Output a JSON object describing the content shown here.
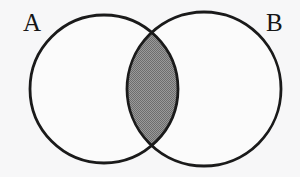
{
  "figure": {
    "type": "venn-diagram",
    "background_color": "#f7f7f8",
    "stroke_color": "#1a1a1a",
    "stroke_width": 2.8,
    "fill_color": "#fbfbfb",
    "shade_color": "#8a8a8a",
    "shade_pattern": "halftone-dither"
  },
  "sets": [
    {
      "id": "A",
      "label": "A",
      "cx": 104,
      "cy": 89,
      "r": 74
    },
    {
      "id": "B",
      "label": "B",
      "cx": 204,
      "cy": 89,
      "r": 77
    }
  ],
  "regions": [
    {
      "id": "intersection",
      "name": "A-intersect-B",
      "shaded": true,
      "bounds": {
        "x1": 127,
        "y1": 31,
        "x2": 178,
        "y2": 148
      }
    },
    {
      "id": "a-only",
      "name": "A-only",
      "shaded": false
    },
    {
      "id": "b-only",
      "name": "B-only",
      "shaded": false
    }
  ],
  "labels": {
    "set_a": "A",
    "set_b": "B"
  }
}
